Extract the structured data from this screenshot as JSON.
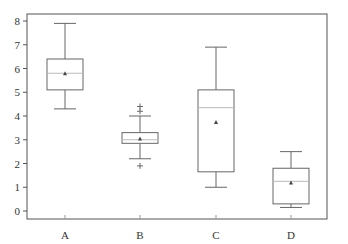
{
  "chart_data": {
    "type": "boxplot",
    "title": "",
    "xlabel": "",
    "ylabel": "",
    "categories": [
      "A",
      "B",
      "C",
      "D"
    ],
    "ylim": [
      -0.3,
      8.3
    ],
    "yticks": [
      0,
      1,
      2,
      3,
      4,
      5,
      6,
      7,
      8
    ],
    "grid": false,
    "legend": null,
    "boxes": [
      {
        "label": "A",
        "whisker_low": 4.3,
        "q1": 5.1,
        "median": 5.8,
        "q3": 6.4,
        "whisker_high": 7.9,
        "mean": 5.8,
        "outliers": []
      },
      {
        "label": "B",
        "whisker_low": 2.2,
        "q1": 2.85,
        "median": 3.0,
        "q3": 3.3,
        "whisker_high": 4.0,
        "mean": 3.05,
        "outliers": [
          4.2,
          4.4,
          1.9
        ]
      },
      {
        "label": "C",
        "whisker_low": 1.0,
        "q1": 1.65,
        "median": 4.35,
        "q3": 5.1,
        "whisker_high": 6.9,
        "mean": 3.75,
        "outliers": []
      },
      {
        "label": "D",
        "whisker_low": 0.15,
        "q1": 0.3,
        "median": 1.25,
        "q3": 1.8,
        "whisker_high": 2.5,
        "mean": 1.2,
        "outliers": []
      }
    ],
    "colors": {
      "frame": "#555555",
      "box": "#666666",
      "median": "#bbbbbb",
      "mean_marker": "#444444"
    }
  }
}
